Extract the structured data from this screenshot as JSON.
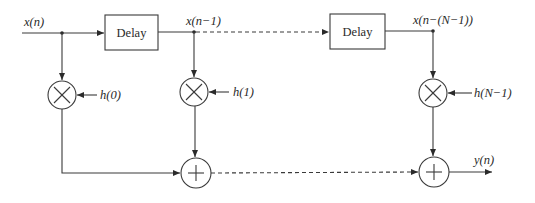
{
  "diagram": {
    "type": "FIR filter direct-form block diagram",
    "signals": {
      "input": "x(n)",
      "delayed_1": "x(n−1)",
      "delayed_last": "x(n−(N−1))",
      "output": "y(n)"
    },
    "delay_blocks": [
      {
        "label": "Delay"
      },
      {
        "label": "Delay"
      }
    ],
    "coefficients": [
      {
        "label": "h(0)"
      },
      {
        "label": "h(1)"
      },
      {
        "label": "h(N−1)"
      }
    ],
    "multiplier_symbol": "×",
    "adder_symbol": "+",
    "colors": {
      "line": "#3a3a3a",
      "text": "#2a2a2a",
      "background": "#ffffff"
    }
  }
}
